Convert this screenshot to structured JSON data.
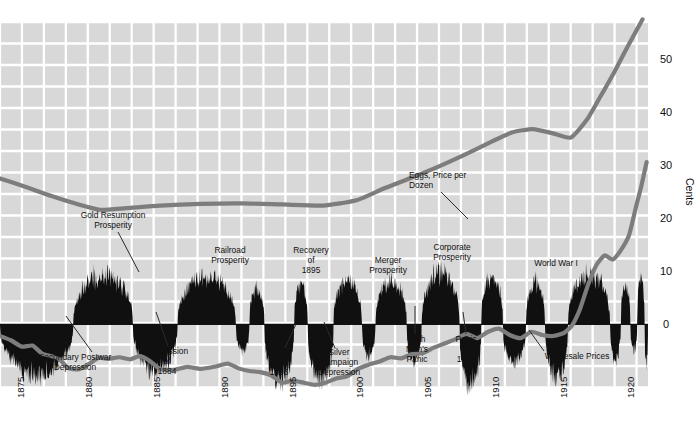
{
  "chart_data": {
    "type": "area",
    "title": "",
    "subtitle": "",
    "xlabel": "",
    "ylabel": "Cents",
    "grid": true,
    "legend_position": "inline-annotations",
    "xlim": [
      1873.2,
      1921.0
    ],
    "ylim": [
      -12,
      57
    ],
    "x_ticks": [
      "1875",
      "1880",
      "1885",
      "1890",
      "1895",
      "1900",
      "1905",
      "1910",
      "1915",
      "1920"
    ],
    "x_tick_values": [
      1875,
      1880,
      1885,
      1890,
      1895,
      1900,
      1905,
      1910,
      1915,
      1920
    ],
    "y_ticks": [
      "50",
      "40",
      "30",
      "20",
      "10",
      "0"
    ],
    "y_tick_values": [
      50,
      40,
      30,
      20,
      10,
      0
    ],
    "series": [
      {
        "name": "Eggs, Price per Dozen",
        "type": "line",
        "color": "#7d7d7d",
        "x": [
          1873.2,
          1875.0,
          1877.0,
          1879.0,
          1880.6,
          1882.5,
          1885.0,
          1888.0,
          1891.0,
          1894.0,
          1897.0,
          1899.5,
          1901.5,
          1903.5,
          1905.5,
          1907.5,
          1909.5,
          1911.0,
          1912.5,
          1914.0,
          1915.3,
          1916.5,
          1917.5,
          1918.5,
          1919.5,
          1920.6
        ],
        "values": [
          27.5,
          26.0,
          24.2,
          22.6,
          21.6,
          21.9,
          22.4,
          22.7,
          22.8,
          22.6,
          22.4,
          23.4,
          25.6,
          27.6,
          29.7,
          32.0,
          34.5,
          36.2,
          36.8,
          36.0,
          35.2,
          38.6,
          43.0,
          47.5,
          52.4,
          57.5
        ]
      },
      {
        "name": "Wholesale Prices",
        "type": "line",
        "color": "#7d7d7d",
        "x": [
          1873.2,
          1874.0,
          1874.8,
          1875.6,
          1876.3,
          1877.0,
          1877.6,
          1878.2,
          1879.0,
          1879.8,
          1880.5,
          1881.2,
          1882.0,
          1882.8,
          1883.5,
          1884.2,
          1885.0,
          1886.0,
          1887.0,
          1888.0,
          1889.0,
          1890.0,
          1890.8,
          1891.6,
          1892.4,
          1893.2,
          1894.0,
          1894.8,
          1895.6,
          1896.4,
          1897.2,
          1898.0,
          1898.8,
          1899.6,
          1900.4,
          1901.2,
          1902.0,
          1902.8,
          1903.6,
          1904.4,
          1905.2,
          1906.0,
          1906.8,
          1907.6,
          1908.4,
          1909.2,
          1910.0,
          1910.8,
          1911.6,
          1912.4,
          1913.2,
          1914.0,
          1914.8,
          1915.4,
          1916.0,
          1916.6,
          1917.2,
          1917.8,
          1918.4,
          1919.0,
          1919.6,
          1920.1,
          1920.5,
          1920.9
        ],
        "values": [
          -2.2,
          -3.0,
          -4.2,
          -4.0,
          -5.5,
          -6.0,
          -6.6,
          -8.2,
          -8.5,
          -7.4,
          -6.3,
          -6.5,
          -6.2,
          -6.6,
          -6.0,
          -6.8,
          -8.4,
          -8.6,
          -8.0,
          -8.4,
          -8.0,
          -7.4,
          -8.3,
          -8.8,
          -9.0,
          -9.6,
          -11.0,
          -10.6,
          -11.0,
          -11.4,
          -11.0,
          -10.2,
          -9.8,
          -8.4,
          -7.6,
          -7.0,
          -6.2,
          -6.4,
          -5.6,
          -5.4,
          -4.4,
          -3.6,
          -2.8,
          -1.8,
          -2.6,
          -1.4,
          -0.8,
          -2.0,
          -2.6,
          -1.4,
          -2.0,
          -2.2,
          -1.6,
          -0.2,
          3.0,
          7.6,
          11.2,
          13.0,
          12.2,
          14.0,
          16.8,
          22.0,
          26.0,
          30.6
        ]
      },
      {
        "name": "Business Activity Index",
        "type": "area-deviation",
        "color": "#101010",
        "baseline": 0,
        "description": "Black filled deviation band above/below trend line"
      }
    ],
    "annotations": [
      {
        "label": "Gold Resumption\nProsperity",
        "lines": [
          "Gold Resumption",
          "Prosperity"
        ],
        "text_x": 113,
        "text_y": 218,
        "anchor": "middle",
        "leader": [
          [
            118,
            232
          ],
          [
            139,
            272
          ]
        ]
      },
      {
        "label": "Secondary Postwar\nDepression",
        "lines": [
          "Secondary Postwar",
          "Depression"
        ],
        "text_x": 75,
        "text_y": 360,
        "anchor": "middle",
        "leader": [
          [
            92,
            352
          ],
          [
            66,
            316
          ]
        ]
      },
      {
        "label": "Depression\nof\n1884",
        "lines": [
          "Depression",
          "of",
          "1884"
        ],
        "text_x": 167,
        "text_y": 354,
        "anchor": "middle",
        "leader": [
          [
            168,
            346
          ],
          [
            156,
            312
          ]
        ]
      },
      {
        "label": "Railroad\nProsperity",
        "lines": [
          "Railroad",
          "Prosperity"
        ],
        "text_x": 230,
        "text_y": 253,
        "anchor": "middle",
        "leader": null
      },
      {
        "label": "Panic\nof\n1893",
        "lines": [
          "Panic",
          "of",
          "1893"
        ],
        "text_x": 279,
        "text_y": 355,
        "anchor": "middle",
        "leader": [
          [
            285,
            348
          ],
          [
            296,
            324
          ]
        ]
      },
      {
        "label": "Recovery\nof\n1895",
        "lines": [
          "Recovery",
          "of",
          "1895"
        ],
        "text_x": 311,
        "text_y": 253,
        "anchor": "middle",
        "leader": null
      },
      {
        "label": "Silver\nCampaign\nDepression",
        "lines": [
          "Silver",
          "Campaign",
          "Depression"
        ],
        "text_x": 339,
        "text_y": 355,
        "anchor": "middle",
        "leader": [
          [
            335,
            348
          ],
          [
            324,
            322
          ]
        ]
      },
      {
        "label": "Merger\nProsperity",
        "lines": [
          "Merger",
          "Prosperity"
        ],
        "text_x": 388,
        "text_y": 263,
        "anchor": "middle",
        "leader": null
      },
      {
        "label": "Rich\nMan's\nPanic",
        "lines": [
          "Rich",
          "Man's",
          "Panic"
        ],
        "text_x": 417,
        "text_y": 342,
        "anchor": "middle",
        "leader": [
          [
            415,
            334
          ],
          [
            415,
            306
          ]
        ]
      },
      {
        "label": "Corporate\nProsperity",
        "lines": [
          "Corporate",
          "Prosperity"
        ],
        "text_x": 452,
        "text_y": 250,
        "anchor": "middle",
        "leader": null
      },
      {
        "label": "Panic\nof\n1907",
        "lines": [
          "Panic",
          "of",
          "1907"
        ],
        "text_x": 466,
        "text_y": 342,
        "anchor": "middle",
        "leader": [
          [
            466,
            334
          ],
          [
            463,
            312
          ]
        ]
      },
      {
        "label": "World War I",
        "lines": [
          "World War I"
        ],
        "text_x": 556,
        "text_y": 266,
        "anchor": "middle",
        "leader": null
      },
      {
        "label": "Wholesale Prices",
        "lines": [
          "Wholesale Prices"
        ],
        "text_x": 577,
        "text_y": 359,
        "anchor": "middle",
        "leader": [
          [
            544,
            351
          ],
          [
            529,
            330
          ]
        ]
      },
      {
        "label": "Eggs, Price per\nDozen",
        "lines": [
          "Eggs, Price per",
          "Dozen"
        ],
        "text_x": 409,
        "text_y": 178,
        "anchor": "start",
        "leader": [
          [
            441,
            192
          ],
          [
            468,
            219
          ]
        ]
      }
    ]
  },
  "style": {
    "grid_color": "#d8d8d8",
    "grid_line_color": "#ffffff",
    "background": "#ffffff",
    "line_color": "#7d7d7d",
    "band_color": "#101010",
    "text_color": "#111111"
  },
  "axis": {
    "y_title": "Cents"
  }
}
